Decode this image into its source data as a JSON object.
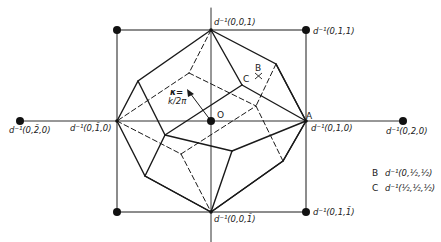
{
  "figure": {
    "colors": {
      "ink": "#1a1a1a",
      "background": "#ffffff"
    },
    "axes": {
      "vertical": {
        "x": 211,
        "y1": 8,
        "y2": 242
      },
      "horizontal": {
        "y": 121,
        "x1": 20,
        "x2": 403
      }
    },
    "lattice_points": [
      {
        "id": "p001",
        "label": "d⁻¹(0,0,1)",
        "x": 211,
        "y": 30
      },
      {
        "id": "p011",
        "label": "d⁻¹(0,1,1)",
        "x": 306,
        "y": 30
      },
      {
        "id": "p0m10",
        "label": "d⁻¹(0,1̄,0)",
        "x": 117,
        "y": 121
      },
      {
        "id": "p010",
        "label": "d⁻¹(0,1,0)",
        "x": 306,
        "y": 121
      },
      {
        "id": "p0m20",
        "label": "d⁻¹(0,2̄,0)",
        "x": 20,
        "y": 121
      },
      {
        "id": "p020",
        "label": "d⁻¹(0,2,0)",
        "x": 403,
        "y": 121
      },
      {
        "id": "p00m1",
        "label": "d⁻¹(0,0,1̄)",
        "x": 211,
        "y": 212
      },
      {
        "id": "p01m1",
        "label": "d⁻¹(0,1,1̄)",
        "x": 306,
        "y": 212
      },
      {
        "id": "corner_tl",
        "label": "",
        "x": 117,
        "y": 30
      },
      {
        "id": "corner_bl",
        "label": "",
        "x": 117,
        "y": 212
      }
    ],
    "point_labels": {
      "origin": "O",
      "A": "A",
      "B": "B",
      "C": "C"
    },
    "vector_label": {
      "line1": "κ=",
      "line2": "k/2π"
    },
    "legend": [
      {
        "key": "B",
        "value": "d⁻¹(0,½,½)"
      },
      {
        "key": "C",
        "value": "d⁻¹(½,½,½)"
      }
    ]
  }
}
